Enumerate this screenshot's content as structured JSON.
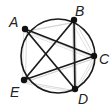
{
  "diagram": {
    "type": "circle-pentagram",
    "circle": {
      "cx": 58,
      "cy": 56,
      "r": 37
    },
    "points": [
      {
        "id": "A",
        "label": "A",
        "x": 25,
        "y": 29,
        "lx": 9,
        "ly": 15
      },
      {
        "id": "B",
        "label": "B",
        "x": 74,
        "y": 20,
        "lx": 75,
        "ly": 4
      },
      {
        "id": "C",
        "label": "C",
        "x": 94,
        "y": 56,
        "lx": 99,
        "ly": 52
      },
      {
        "id": "D",
        "label": "D",
        "x": 75,
        "y": 89,
        "lx": 78,
        "ly": 92
      },
      {
        "id": "E",
        "label": "E",
        "x": 24,
        "y": 80,
        "lx": 10,
        "ly": 85
      }
    ],
    "dark_edges": [
      [
        "A",
        "C"
      ],
      [
        "A",
        "D"
      ],
      [
        "B",
        "D"
      ],
      [
        "B",
        "E"
      ],
      [
        "C",
        "E"
      ]
    ],
    "faint_edges": [
      [
        "A",
        "B"
      ],
      [
        "B",
        "C"
      ],
      [
        "C",
        "D"
      ],
      [
        "D",
        "E"
      ],
      [
        "E",
        "A"
      ],
      [
        "A",
        "C"
      ],
      [
        "B",
        "D"
      ],
      [
        "C",
        "E"
      ]
    ],
    "colors": {
      "stroke": "#1a1a1a",
      "faint": "#cfcfcf",
      "point": "#111111",
      "label": "#222222"
    }
  }
}
